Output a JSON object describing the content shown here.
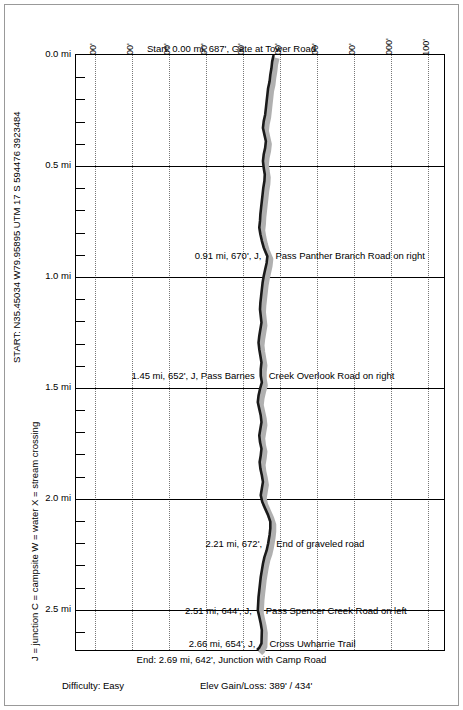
{
  "chart_data": {
    "type": "line",
    "title": "",
    "xlabel": "",
    "ylabel": "",
    "orientation": "vertical-distance",
    "xlim": [
      150,
      1150
    ],
    "ylim": [
      0,
      2.69
    ],
    "grid": true,
    "x_ticks": [
      "200'",
      "300'",
      "400'",
      "500'",
      "600'",
      "700'",
      "800'",
      "900'",
      "1000'",
      "1100'"
    ],
    "x_tick_values": [
      200,
      300,
      400,
      500,
      600,
      700,
      800,
      900,
      1000,
      1100
    ],
    "y_ticks": [
      "0.0 mi",
      "0.5 mi",
      "1.0 mi",
      "1.5 mi",
      "2.0 mi",
      "2.5 mi"
    ],
    "y_tick_values": [
      0.0,
      0.5,
      1.0,
      1.5,
      2.0,
      2.5
    ],
    "y_minor_step": 0.1,
    "series": [
      {
        "name": "Elevation profile",
        "points": [
          [
            687,
            0.0
          ],
          [
            683,
            0.03
          ],
          [
            681,
            0.06
          ],
          [
            678,
            0.09
          ],
          [
            676,
            0.12
          ],
          [
            672,
            0.15
          ],
          [
            670,
            0.18
          ],
          [
            668,
            0.21
          ],
          [
            666,
            0.24
          ],
          [
            664,
            0.27
          ],
          [
            660,
            0.3
          ],
          [
            658,
            0.33
          ],
          [
            662,
            0.36
          ],
          [
            666,
            0.39
          ],
          [
            664,
            0.42
          ],
          [
            660,
            0.45
          ],
          [
            658,
            0.48
          ],
          [
            660,
            0.51
          ],
          [
            663,
            0.54
          ],
          [
            662,
            0.57
          ],
          [
            659,
            0.6
          ],
          [
            657,
            0.63
          ],
          [
            655,
            0.66
          ],
          [
            653,
            0.69
          ],
          [
            651,
            0.72
          ],
          [
            650,
            0.75
          ],
          [
            648,
            0.78
          ],
          [
            651,
            0.81
          ],
          [
            655,
            0.84
          ],
          [
            660,
            0.87
          ],
          [
            670,
            0.91
          ],
          [
            668,
            0.94
          ],
          [
            664,
            0.97
          ],
          [
            660,
            1.0
          ],
          [
            657,
            1.03
          ],
          [
            655,
            1.06
          ],
          [
            653,
            1.09
          ],
          [
            651,
            1.12
          ],
          [
            650,
            1.15
          ],
          [
            652,
            1.18
          ],
          [
            654,
            1.21
          ],
          [
            651,
            1.24
          ],
          [
            648,
            1.27
          ],
          [
            646,
            1.3
          ],
          [
            648,
            1.33
          ],
          [
            651,
            1.36
          ],
          [
            654,
            1.39
          ],
          [
            652,
            1.42
          ],
          [
            652,
            1.45
          ],
          [
            655,
            1.48
          ],
          [
            650,
            1.51
          ],
          [
            646,
            1.54
          ],
          [
            644,
            1.57
          ],
          [
            648,
            1.6
          ],
          [
            652,
            1.63
          ],
          [
            654,
            1.66
          ],
          [
            651,
            1.69
          ],
          [
            648,
            1.72
          ],
          [
            650,
            1.75
          ],
          [
            654,
            1.78
          ],
          [
            652,
            1.81
          ],
          [
            649,
            1.84
          ],
          [
            651,
            1.87
          ],
          [
            655,
            1.9
          ],
          [
            658,
            1.93
          ],
          [
            655,
            1.96
          ],
          [
            652,
            1.99
          ],
          [
            656,
            2.02
          ],
          [
            664,
            2.05
          ],
          [
            672,
            2.08
          ],
          [
            678,
            2.11
          ],
          [
            678,
            2.14
          ],
          [
            676,
            2.17
          ],
          [
            672,
            2.21
          ],
          [
            668,
            2.24
          ],
          [
            662,
            2.27
          ],
          [
            658,
            2.3
          ],
          [
            655,
            2.33
          ],
          [
            652,
            2.36
          ],
          [
            650,
            2.39
          ],
          [
            648,
            2.42
          ],
          [
            646,
            2.45
          ],
          [
            645,
            2.48
          ],
          [
            644,
            2.51
          ],
          [
            648,
            2.54
          ],
          [
            652,
            2.57
          ],
          [
            655,
            2.6
          ],
          [
            654,
            2.66
          ],
          [
            648,
            2.68
          ],
          [
            642,
            2.69
          ]
        ]
      }
    ],
    "annotations": [
      {
        "id": "start",
        "text": "Start: 0.00 mi, 687', Gate at Tower Road",
        "mile": 0.0,
        "elev": 687
      },
      {
        "id": "wp1",
        "text_left": "0.91 mi, 670', J,",
        "text_right": "Pass Panther Branch Road on right",
        "mile": 0.91,
        "elev": 670
      },
      {
        "id": "wp2",
        "text_left": "1.45 mi, 652', J, Pass Barnes",
        "text_right": "Creek Overlook Road on right",
        "mile": 1.45,
        "elev": 652
      },
      {
        "id": "wp3",
        "text_left": "2.21 mi, 672',",
        "text_right": "End of graveled road",
        "mile": 2.21,
        "elev": 672
      },
      {
        "id": "wp4",
        "text_left": "2.51 mi, 644', J,",
        "text_right": "Pass Spencer Creek Road on left",
        "mile": 2.51,
        "elev": 644
      },
      {
        "id": "wp5",
        "text_left": "2.66 mi, 654', J,",
        "text_right": "Cross Uwharrie Trail",
        "mile": 2.66,
        "elev": 654
      },
      {
        "id": "end",
        "text": "End: 2.69 mi, 642', Junction with Camp Road",
        "mile": 2.69,
        "elev": 642
      }
    ]
  },
  "side": {
    "start_coords": "START: N35.45034 W79.95895   UTM 17 S 594476 3923484",
    "legend": "J = junction   C = campsite   W = water   X = stream crossing"
  },
  "footer": {
    "difficulty": "Difficulty: Easy",
    "elev": "Elev Gain/Loss: 389' / 434'"
  }
}
